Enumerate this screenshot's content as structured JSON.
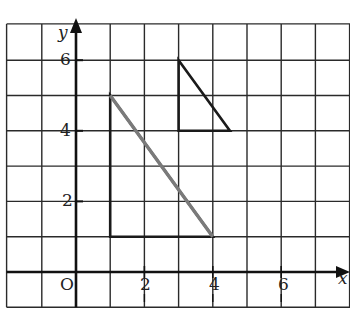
{
  "figure": {
    "type": "coordinate-grid",
    "origin_label": "O",
    "x_axis_label": "x",
    "y_axis_label": "y",
    "x_tick_labels": [
      "2",
      "4",
      "6"
    ],
    "y_tick_labels": [
      "2",
      "4",
      "6"
    ],
    "grid": {
      "x_min": -2,
      "x_max": 8,
      "y_min": -1,
      "y_max": 7,
      "step": 1
    },
    "colors": {
      "grid": "#2a2a2a",
      "axis": "#111111",
      "shape_edge": "#1a1a1a",
      "hypotenuse_highlight": "#7a7a7a"
    },
    "shapes": [
      {
        "name": "large-triangle",
        "vertices": [
          [
            1,
            5
          ],
          [
            1,
            1
          ],
          [
            4,
            1
          ]
        ],
        "highlighted_edge": [
          [
            1,
            5
          ],
          [
            4,
            1
          ]
        ]
      },
      {
        "name": "small-triangle",
        "vertices": [
          [
            3,
            6
          ],
          [
            3,
            4
          ],
          [
            4.5,
            4
          ]
        ]
      }
    ]
  }
}
